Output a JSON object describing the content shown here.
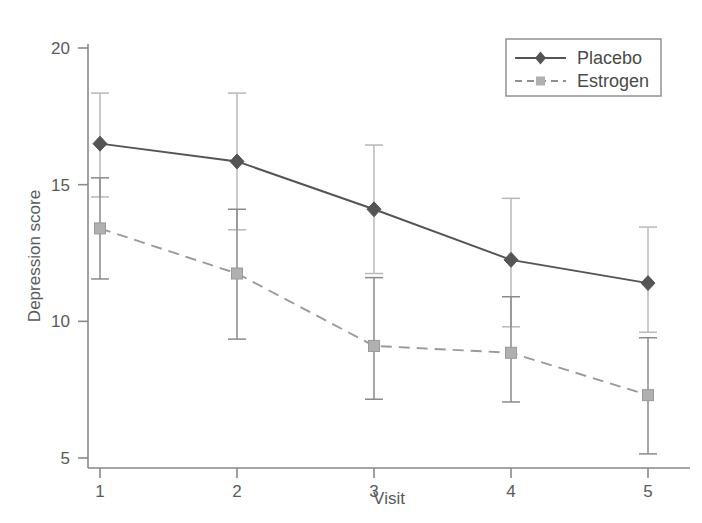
{
  "chart_data": {
    "type": "line",
    "title": "",
    "xlabel": "Visit",
    "ylabel": "Depression score",
    "x": [
      1,
      2,
      3,
      4,
      5
    ],
    "xticklabels": [
      "1",
      "2",
      "3",
      "4",
      "5"
    ],
    "yticklabels": [
      "5",
      "10",
      "15",
      "20"
    ],
    "yticks": [
      5,
      10,
      15,
      20
    ],
    "xlim": [
      0.7,
      5.35
    ],
    "ylim": [
      4.55,
      20.6
    ],
    "grid": false,
    "legend_position": "top-right",
    "error_bars": "yes",
    "series": [
      {
        "name": "Placebo",
        "marker": "diamond",
        "linestyle": "solid",
        "color": "#545454",
        "values": [
          16.5,
          15.85,
          14.1,
          12.25,
          11.4
        ],
        "err_low": [
          14.55,
          13.35,
          11.75,
          9.8,
          9.6
        ],
        "err_high": [
          18.35,
          18.35,
          16.45,
          14.5,
          13.45
        ]
      },
      {
        "name": "Estrogen",
        "marker": "square",
        "linestyle": "dashed",
        "color": "#9a9a9a",
        "values": [
          13.4,
          11.75,
          9.1,
          8.85,
          7.3
        ],
        "err_low": [
          11.55,
          9.35,
          7.15,
          7.05,
          5.15
        ],
        "err_high": [
          15.25,
          14.1,
          11.6,
          10.9,
          9.4
        ]
      }
    ]
  },
  "legend": {
    "entries": [
      {
        "label": "Placebo"
      },
      {
        "label": "Estrogen"
      }
    ]
  },
  "axes": {
    "x_title": "Visit",
    "y_title": "Depression score"
  }
}
